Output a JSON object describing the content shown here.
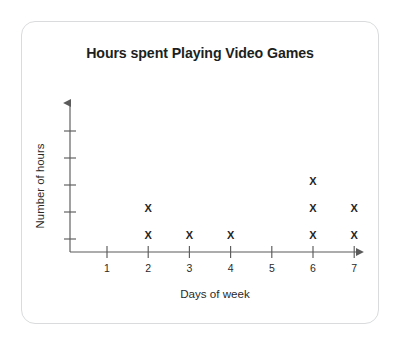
{
  "card": {
    "background_color": "#ffffff",
    "border_color": "#d9dbdd"
  },
  "chart": {
    "title": "Hours spent Playing Video Games",
    "x_axis_label": "Days of week",
    "y_axis_label": "Number of hours",
    "x_tick_labels": [
      "1",
      "2",
      "3",
      "4",
      "5",
      "6",
      "7"
    ],
    "marker_glyph": "X",
    "axis_color": "#5b5b5b",
    "marker_color": "#262626",
    "text_color": "#2b2a29"
  },
  "chart_data": {
    "type": "scatter",
    "title": "Hours spent Playing Video Games",
    "xlabel": "Days of week",
    "ylabel": "Number of hours",
    "categories": [
      "1",
      "2",
      "3",
      "4",
      "5",
      "6",
      "7"
    ],
    "values": [
      0,
      2,
      1,
      1,
      0,
      3,
      2
    ],
    "marker": "X",
    "grid": false,
    "legend": "none",
    "xlim": [
      0,
      7
    ],
    "ylim": [
      0,
      5
    ],
    "y_tick_count": 5,
    "y_ticks_labeled": false,
    "note": "Dot plot: each X stacked above a day represents one hour."
  }
}
